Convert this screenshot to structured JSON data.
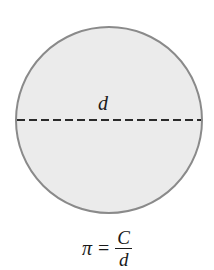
{
  "diagram": {
    "shape": "circle",
    "fill_color": "#ebebeb",
    "stroke_color": "#8a8a8a",
    "diameter_line": "dashed",
    "diameter_label": "d"
  },
  "formula": {
    "lhs": "π",
    "equals": "=",
    "numerator": "C",
    "denominator": "d"
  }
}
